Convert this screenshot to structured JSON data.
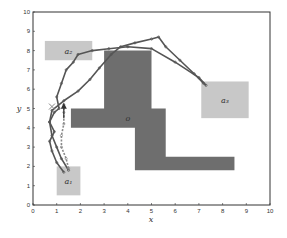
{
  "chart_data": {
    "type": "scatter",
    "title": "",
    "xlabel": "x",
    "ylabel": "y",
    "xlim": [
      0,
      10
    ],
    "ylim": [
      0,
      10
    ],
    "xticks": [
      0,
      1,
      2,
      3,
      4,
      5,
      6,
      7,
      8,
      9,
      10
    ],
    "yticks": [
      0,
      1,
      2,
      3,
      4,
      5,
      6,
      7,
      8,
      9,
      10
    ],
    "grid": false,
    "legend": null,
    "regions": [
      {
        "name": "a1",
        "label": "a₁",
        "x": [
          1.0,
          2.0
        ],
        "y": [
          0.5,
          2.0
        ],
        "color": "#c8c8c8"
      },
      {
        "name": "a2",
        "label": "a₂",
        "x": [
          0.5,
          2.5
        ],
        "y": [
          7.5,
          8.5
        ],
        "color": "#c8c8c8"
      },
      {
        "name": "a3",
        "label": "a₃",
        "x": [
          7.1,
          9.1
        ],
        "y": [
          4.5,
          6.4
        ],
        "color": "#c8c8c8"
      }
    ],
    "obstacle": {
      "name": "o",
      "label": "o",
      "color": "#6e6e6e",
      "polygon": [
        [
          3.0,
          8.0
        ],
        [
          5.0,
          8.0
        ],
        [
          5.0,
          5.0
        ],
        [
          5.6,
          5.0
        ],
        [
          5.6,
          2.5
        ],
        [
          8.5,
          2.5
        ],
        [
          8.5,
          1.8
        ],
        [
          4.3,
          1.8
        ],
        [
          4.3,
          4.0
        ],
        [
          1.6,
          4.0
        ],
        [
          1.6,
          5.0
        ],
        [
          3.0,
          5.0
        ]
      ]
    },
    "series": [
      {
        "name": "trajectory-1",
        "style": "solid-markers",
        "color": "#555555",
        "points": [
          [
            1.3,
            1.7
          ],
          [
            1.0,
            2.2
          ],
          [
            0.8,
            2.8
          ],
          [
            0.7,
            3.3
          ],
          [
            0.9,
            3.8
          ],
          [
            0.7,
            4.3
          ],
          [
            0.9,
            4.8
          ],
          [
            1.1,
            5.0
          ],
          [
            1.0,
            5.6
          ],
          [
            1.2,
            6.3
          ],
          [
            1.4,
            7.0
          ],
          [
            1.7,
            7.4
          ],
          [
            1.9,
            7.8
          ],
          [
            2.5,
            8.0
          ],
          [
            3.2,
            8.1
          ],
          [
            4.0,
            8.2
          ],
          [
            5.0,
            8.1
          ],
          [
            6.0,
            7.4
          ],
          [
            7.0,
            6.6
          ],
          [
            7.3,
            6.2
          ]
        ]
      },
      {
        "name": "trajectory-2",
        "style": "solid-markers",
        "color": "#555555",
        "points": [
          [
            1.5,
            1.8
          ],
          [
            1.2,
            2.4
          ],
          [
            1.0,
            3.0
          ],
          [
            0.8,
            3.6
          ],
          [
            0.7,
            4.3
          ],
          [
            0.8,
            4.9
          ],
          [
            1.3,
            5.4
          ],
          [
            1.9,
            5.9
          ],
          [
            2.4,
            6.5
          ],
          [
            2.8,
            7.1
          ],
          [
            3.3,
            7.8
          ],
          [
            3.7,
            8.2
          ],
          [
            4.3,
            8.4
          ],
          [
            5.0,
            8.6
          ],
          [
            5.3,
            8.7
          ],
          [
            5.6,
            8.2
          ],
          [
            6.2,
            7.5
          ],
          [
            6.8,
            6.8
          ],
          [
            7.2,
            6.3
          ]
        ]
      },
      {
        "name": "trajectory-3",
        "style": "dashed-markers",
        "color": "#8a8a8a",
        "points": [
          [
            1.5,
            1.9
          ],
          [
            1.4,
            2.4
          ],
          [
            1.2,
            3.0
          ],
          [
            1.2,
            3.6
          ],
          [
            1.3,
            4.2
          ],
          [
            1.3,
            4.8
          ],
          [
            1.3,
            5.2
          ]
        ]
      }
    ],
    "annotations": [
      {
        "type": "arrow",
        "x": 1.3,
        "y_from": 4.5,
        "y_to": 5.2,
        "direction": "up"
      },
      {
        "type": "cross-marker",
        "x": 0.8,
        "y": 5.1
      }
    ]
  }
}
